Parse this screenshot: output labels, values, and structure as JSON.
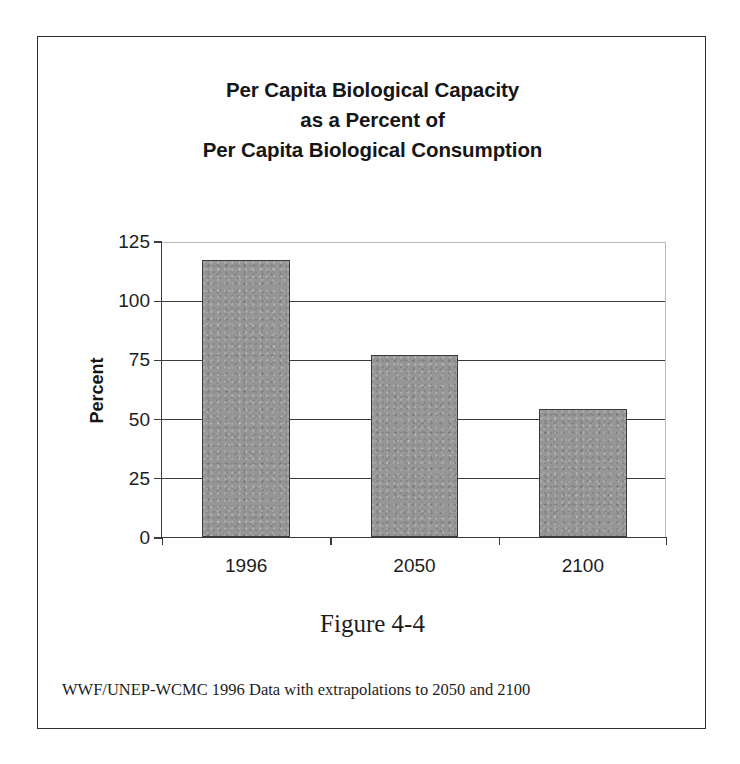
{
  "figure": {
    "caption": "Figure 4-4",
    "footnote": "WWF/UNEP-WCMC 1996 Data with extrapolations to 2050 and 2100",
    "border_color": "#2e2e2e",
    "background_color": "#ffffff"
  },
  "chart_data": {
    "type": "bar",
    "title": "Per Capita Biological Capacity as a Percent of Per Capita Biological Consumption",
    "title_lines": [
      "Per Capita Biological Capacity",
      "as a Percent of",
      "Per Capita Biological Consumption"
    ],
    "categories": [
      "1996",
      "2050",
      "2100"
    ],
    "values": [
      117,
      77,
      54
    ],
    "series": [
      {
        "name": "Per Capita Biological Capacity as a Percent of Consumption",
        "values": [
          117,
          77,
          54
        ]
      }
    ],
    "xlabel": "",
    "ylabel": "Percent",
    "ylim": [
      0,
      125
    ],
    "ytick_values": [
      0,
      25,
      50,
      75,
      100,
      125
    ],
    "ytick_labels": [
      "0",
      "25",
      "50",
      "75",
      "100",
      "125"
    ],
    "grid": true,
    "grid_axis": "y",
    "legend": false,
    "legend_position": "none",
    "bar_color": "#969696",
    "bar_border_color": "#3a3a3a",
    "axis_color": "#3b3b3b",
    "annotations": []
  }
}
